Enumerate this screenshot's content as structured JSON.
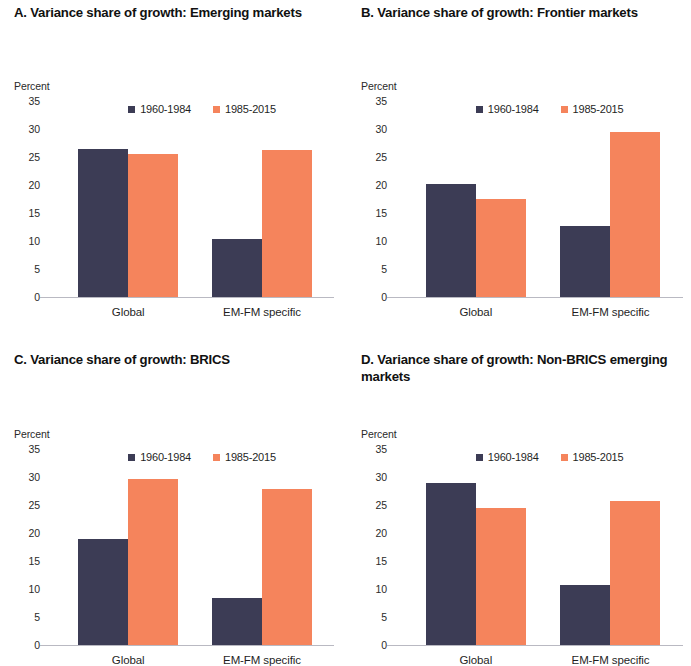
{
  "figure": {
    "unit_label": "Percent",
    "series_colors": {
      "series_1960_1984": "#3c3c55",
      "series_1985_2015": "#f5845c"
    },
    "axis_color": "#b9b9c2"
  },
  "panels": [
    {
      "id": "A",
      "title": "A. Variance share of growth: Emerging markets",
      "unit": "Percent",
      "legend": [
        {
          "label": "1960-1984",
          "color": "#3c3c55"
        },
        {
          "label": "1985-2015",
          "color": "#f5845c"
        }
      ],
      "chart_data": {
        "type": "bar",
        "title": "A. Variance share of growth: Emerging markets",
        "categories": [
          "Global",
          "EM-FM specific"
        ],
        "series": [
          {
            "name": "1960-1984",
            "values": [
              26.5,
              10.3
            ]
          },
          {
            "name": "1985-2015",
            "values": [
              25.6,
              26.3
            ]
          }
        ],
        "xlabel": "",
        "ylabel": "Percent",
        "ylim": [
          0,
          35
        ],
        "yticks": [
          0,
          5,
          10,
          15,
          20,
          25,
          30,
          35
        ],
        "grid": false,
        "legend_position": "top-right"
      }
    },
    {
      "id": "B",
      "title": "B. Variance share of growth: Frontier markets",
      "unit": "Percent",
      "legend": [
        {
          "label": "1960-1984",
          "color": "#3c3c55"
        },
        {
          "label": "1985-2015",
          "color": "#f5845c"
        }
      ],
      "chart_data": {
        "type": "bar",
        "title": "B. Variance share of growth: Frontier markets",
        "categories": [
          "Global",
          "EM-FM specific"
        ],
        "series": [
          {
            "name": "1960-1984",
            "values": [
              20.2,
              12.6
            ]
          },
          {
            "name": "1985-2015",
            "values": [
              17.5,
              29.5
            ]
          }
        ],
        "xlabel": "",
        "ylabel": "Percent",
        "ylim": [
          0,
          35
        ],
        "yticks": [
          0,
          5,
          10,
          15,
          20,
          25,
          30,
          35
        ],
        "grid": false,
        "legend_position": "top-right"
      }
    },
    {
      "id": "C",
      "title": "C. Variance share of growth: BRICS",
      "unit": "Percent",
      "legend": [
        {
          "label": "1960-1984",
          "color": "#3c3c55"
        },
        {
          "label": "1985-2015",
          "color": "#f5845c"
        }
      ],
      "chart_data": {
        "type": "bar",
        "title": "C. Variance share of growth: BRICS",
        "categories": [
          "Global",
          "EM-FM specific"
        ],
        "series": [
          {
            "name": "1960-1984",
            "values": [
              19.0,
              8.4
            ]
          },
          {
            "name": "1985-2015",
            "values": [
              29.7,
              27.8
            ]
          }
        ],
        "xlabel": "",
        "ylabel": "Percent",
        "ylim": [
          0,
          35
        ],
        "yticks": [
          0,
          5,
          10,
          15,
          20,
          25,
          30,
          35
        ],
        "grid": false,
        "legend_position": "top-right"
      }
    },
    {
      "id": "D",
      "title": "D. Variance share of growth: Non-BRICS emerging markets",
      "unit": "Percent",
      "legend": [
        {
          "label": "1960-1984",
          "color": "#3c3c55"
        },
        {
          "label": "1985-2015",
          "color": "#f5845c"
        }
      ],
      "chart_data": {
        "type": "bar",
        "title": "D. Variance share of growth: Non-BRICS emerging markets",
        "categories": [
          "Global",
          "EM-FM specific"
        ],
        "series": [
          {
            "name": "1960-1984",
            "values": [
              29.0,
              10.7
            ]
          },
          {
            "name": "1985-2015",
            "values": [
              24.5,
              25.8
            ]
          }
        ],
        "xlabel": "",
        "ylabel": "Percent",
        "ylim": [
          0,
          35
        ],
        "yticks": [
          0,
          5,
          10,
          15,
          20,
          25,
          30,
          35
        ],
        "grid": false,
        "legend_position": "top-right"
      }
    }
  ]
}
